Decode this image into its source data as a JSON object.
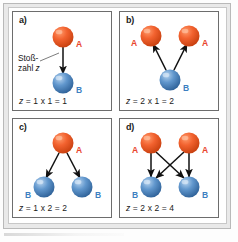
{
  "figure": {
    "colors": {
      "sphere_a": "#ef5a2a",
      "sphere_a_dark": "#c23a10",
      "sphere_a_light": "#ff9a6a",
      "sphere_b": "#5b93cc",
      "sphere_b_dark": "#2f6299",
      "sphere_b_light": "#a9c9ea",
      "label_a": "#e8452b",
      "label_b": "#3d7fc1",
      "arrow": "#111111",
      "panel_border": "#6d6d6d",
      "outer_frame": "#e9e9e9"
    },
    "annotation": {
      "line1": "Stoß-",
      "line2_pre": "zahl ",
      "line2_var": "z"
    },
    "panels": [
      {
        "id": "a",
        "label": "a)",
        "formula_var": "z",
        "formula_rest": " = 1 x 1 = 1",
        "a_count": 1,
        "b_count": 1,
        "arrows": 1,
        "a_labels": [
          "A"
        ],
        "b_labels": [
          "B"
        ]
      },
      {
        "id": "b",
        "label": "b)",
        "formula_var": "z",
        "formula_rest": " = 2 x 1 = 2",
        "a_count": 2,
        "b_count": 1,
        "arrows": 2,
        "a_labels": [
          "A",
          "A"
        ],
        "b_labels": [
          "B"
        ]
      },
      {
        "id": "c",
        "label": "c)",
        "formula_var": "z",
        "formula_rest": " = 1 x 2 = 2",
        "a_count": 1,
        "b_count": 2,
        "arrows": 2,
        "a_labels": [
          "A"
        ],
        "b_labels": [
          "B",
          "B"
        ]
      },
      {
        "id": "d",
        "label": "d)",
        "formula_var": "z",
        "formula_rest": " = 2 x 2 = 4",
        "a_count": 2,
        "b_count": 2,
        "arrows": 4,
        "a_labels": [
          "A",
          "A"
        ],
        "b_labels": [
          "B",
          "B"
        ]
      }
    ]
  }
}
